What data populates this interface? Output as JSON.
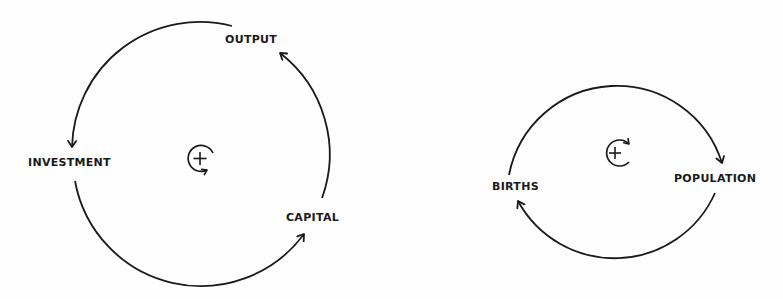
{
  "diagrams": [
    {
      "name": "output-capital-investment-loop",
      "polarity": "+",
      "loop_type": "reinforcing",
      "nodes": [
        {
          "id": "output",
          "label": "OUTPUT"
        },
        {
          "id": "investment",
          "label": "INVESTMENT"
        },
        {
          "id": "capital",
          "label": "CAPITAL"
        }
      ],
      "links": [
        {
          "from": "output",
          "to": "investment"
        },
        {
          "from": "investment",
          "to": "capital"
        },
        {
          "from": "capital",
          "to": "output"
        }
      ],
      "center_symbol": "+",
      "rotation": "clockwise"
    },
    {
      "name": "population-births-loop",
      "polarity": "+",
      "loop_type": "reinforcing",
      "nodes": [
        {
          "id": "births",
          "label": "BIRTHS"
        },
        {
          "id": "population",
          "label": "POPULATION"
        }
      ],
      "links": [
        {
          "from": "births",
          "to": "population"
        },
        {
          "from": "population",
          "to": "births"
        }
      ],
      "center_symbol": "+",
      "rotation": "clockwise"
    }
  ],
  "colors": {
    "ink": "#1a1a1a",
    "background": "#fefefe"
  }
}
